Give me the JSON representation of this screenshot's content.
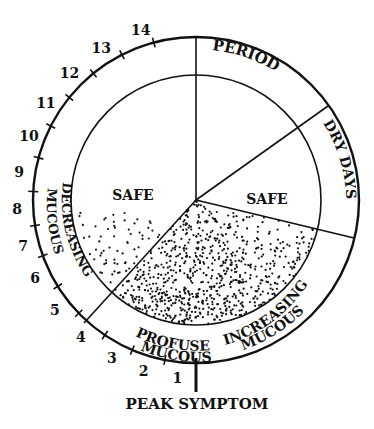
{
  "diagram": {
    "ring_segments": [
      {
        "id": "period",
        "label": "PERIOD"
      },
      {
        "id": "dry-days",
        "label": "DRY DAYS"
      },
      {
        "id": "increasing-mucous",
        "line1": "INCREASING",
        "line2": "MUCOUS"
      },
      {
        "id": "profuse-mucous",
        "line1": "PROFUSE",
        "line2": "MUCOUS"
      },
      {
        "id": "decreasing-mucous",
        "line1": "DECREASING",
        "line2": "MUCOUS"
      }
    ],
    "inner_regions": [
      {
        "id": "safe-left",
        "label": "SAFE"
      },
      {
        "id": "safe-right",
        "label": "SAFE"
      },
      {
        "id": "fertile",
        "label": ""
      }
    ],
    "day_ticks": [
      "1",
      "2",
      "3",
      "4",
      "5",
      "6",
      "7",
      "8",
      "9",
      "10",
      "11",
      "12",
      "13",
      "14"
    ],
    "peak_label": "PEAK SYMPTOM",
    "colors": {
      "ink": "#111111",
      "paper": "#ffffff"
    }
  }
}
